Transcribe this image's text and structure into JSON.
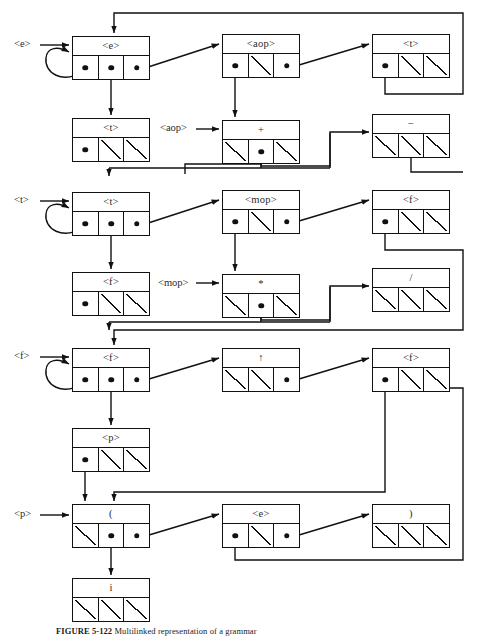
{
  "figure": {
    "caption_label": "FIGURE 5-122",
    "caption_text": "Multilinked representation of a grammar"
  },
  "entry_labels": [
    {
      "name": "e",
      "text": "<e>",
      "x": 14,
      "y": 38
    },
    {
      "name": "aop",
      "text": "<aop>",
      "x": 160,
      "y": 122
    },
    {
      "name": "t",
      "text": "<t>",
      "x": 14,
      "y": 192
    },
    {
      "name": "mop",
      "text": "<mop>",
      "x": 158,
      "y": 277
    },
    {
      "name": "f",
      "text": "<f>",
      "x": 14,
      "y": 348
    },
    {
      "name": "p",
      "text": "<p>",
      "x": 14,
      "y": 508
    }
  ],
  "nodes": [
    {
      "id": "e1",
      "label": "<e>",
      "nt": true,
      "x": 72,
      "y": 36,
      "w": 78,
      "cells": [
        "ptr",
        "ptr",
        "ptr"
      ]
    },
    {
      "id": "aop1",
      "label": "<aop>",
      "nt": true,
      "x": 222,
      "y": 34,
      "w": 78,
      "cells": [
        "ptr",
        "null",
        "ptr"
      ]
    },
    {
      "id": "t2",
      "label": "<t>",
      "nt": true,
      "x": 372,
      "y": 34,
      "w": 78,
      "cells": [
        "ptr",
        "null",
        "null"
      ]
    },
    {
      "id": "t1",
      "label": "<t>",
      "nt": true,
      "x": 72,
      "y": 118,
      "w": 78,
      "cells": [
        "ptr",
        "null",
        "null"
      ]
    },
    {
      "id": "plus",
      "label": "+",
      "nt": false,
      "x": 222,
      "y": 120,
      "w": 78,
      "cells": [
        "null",
        "ptr",
        "null"
      ]
    },
    {
      "id": "minus",
      "label": "−",
      "nt": false,
      "x": 372,
      "y": 114,
      "w": 78,
      "cells": [
        "null",
        "null",
        "null"
      ]
    },
    {
      "id": "t3",
      "label": "<t>",
      "nt": true,
      "x": 72,
      "y": 192,
      "w": 78,
      "cells": [
        "ptr",
        "ptr",
        "ptr"
      ]
    },
    {
      "id": "mop1",
      "label": "<mop>",
      "nt": true,
      "x": 222,
      "y": 190,
      "w": 78,
      "cells": [
        "ptr",
        "null",
        "ptr"
      ]
    },
    {
      "id": "f2",
      "label": "<f>",
      "nt": true,
      "x": 372,
      "y": 190,
      "w": 78,
      "cells": [
        "ptr",
        "null",
        "null"
      ]
    },
    {
      "id": "f1",
      "label": "<f>",
      "nt": true,
      "x": 72,
      "y": 272,
      "w": 78,
      "cells": [
        "ptr",
        "null",
        "null"
      ]
    },
    {
      "id": "mul",
      "label": "*",
      "nt": false,
      "x": 222,
      "y": 274,
      "w": 78,
      "cells": [
        "null",
        "ptr",
        "null"
      ]
    },
    {
      "id": "div",
      "label": "/",
      "nt": false,
      "x": 372,
      "y": 268,
      "w": 78,
      "cells": [
        "null",
        "null",
        "null"
      ]
    },
    {
      "id": "f3",
      "label": "<f>",
      "nt": true,
      "x": 72,
      "y": 348,
      "w": 78,
      "cells": [
        "ptr",
        "ptr",
        "ptr"
      ]
    },
    {
      "id": "pow",
      "label": "↑",
      "nt": false,
      "x": 222,
      "y": 348,
      "w": 78,
      "cells": [
        "null",
        "null",
        "ptr"
      ]
    },
    {
      "id": "f4",
      "label": "<f>",
      "nt": true,
      "x": 372,
      "y": 348,
      "w": 78,
      "cells": [
        "ptr",
        "null",
        "null"
      ]
    },
    {
      "id": "p1",
      "label": "<p>",
      "nt": true,
      "x": 72,
      "y": 428,
      "w": 78,
      "cells": [
        "ptr",
        "null",
        "null"
      ]
    },
    {
      "id": "lpar",
      "label": "(",
      "nt": false,
      "x": 72,
      "y": 504,
      "w": 78,
      "cells": [
        "null",
        "ptr",
        "ptr"
      ]
    },
    {
      "id": "e2",
      "label": "<e>",
      "nt": true,
      "x": 222,
      "y": 504,
      "w": 78,
      "cells": [
        "ptr",
        "null",
        "ptr"
      ]
    },
    {
      "id": "rpar",
      "label": ")",
      "nt": false,
      "x": 372,
      "y": 504,
      "w": 78,
      "cells": [
        "null",
        "null",
        "null"
      ]
    },
    {
      "id": "ivar",
      "label": "i",
      "nt": false,
      "x": 72,
      "y": 578,
      "w": 78,
      "cells": [
        "null",
        "null",
        "null"
      ]
    }
  ]
}
